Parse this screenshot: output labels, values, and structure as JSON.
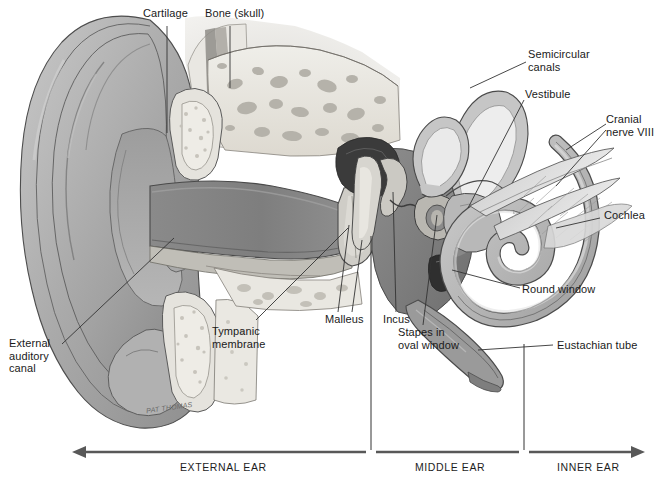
{
  "figure": {
    "artist_signature": "PAT\nTHOMAS"
  },
  "labels": [
    {
      "id": "cartilage",
      "text": "Cartilage",
      "x": 143,
      "y": 12
    },
    {
      "id": "bone-skull",
      "text": "Bone (skull)",
      "x": 205,
      "y": 12
    },
    {
      "id": "semicircular",
      "text": "Semicircular\ncanals",
      "x": 528,
      "y": 52
    },
    {
      "id": "vestibule",
      "text": "Vestibule",
      "x": 525,
      "y": 92
    },
    {
      "id": "cranial-nerve",
      "text": "Cranial\nnerve VIII",
      "x": 610,
      "y": 118
    },
    {
      "id": "cochlea",
      "text": "Cochlea",
      "x": 604,
      "y": 214
    },
    {
      "id": "round-window",
      "text": "Round window",
      "x": 522,
      "y": 288
    },
    {
      "id": "eustachian-tube",
      "text": "Eustachian tube",
      "x": 557,
      "y": 342
    },
    {
      "id": "stapes-oval-window",
      "text": "Stapes in\noval window",
      "x": 400,
      "y": 330
    },
    {
      "id": "incus",
      "text": "Incus",
      "x": 383,
      "y": 317
    },
    {
      "id": "malleus",
      "text": "Malleus",
      "x": 325,
      "y": 317
    },
    {
      "id": "tympanic-membrane",
      "text": "Tympanic\nmembrane",
      "x": 212,
      "y": 329
    },
    {
      "id": "external-auditory",
      "text": "External\nauditory\ncanal",
      "x": 10,
      "y": 341
    }
  ],
  "sections": [
    {
      "id": "external-ear",
      "text": "EXTERNAL EAR",
      "center": 221
    },
    {
      "id": "middle-ear",
      "text": "MIDDLE EAR",
      "center": 447
    },
    {
      "id": "inner-ear",
      "text": "INNER EAR",
      "center": 584
    }
  ],
  "scale_bar": {
    "y": 452,
    "left_x": 72,
    "right_x": 645,
    "divider_x": [
      371,
      524
    ],
    "label_y": 462
  },
  "colors": {
    "ink": "#1a1a1a",
    "leader": "#3a3a3a",
    "skin_light": "#d3d3d3",
    "skin_mid": "#b4b4b4",
    "skin_dark": "#909090",
    "canal_dark": "#878787",
    "bone_pale": "#e7e5df",
    "bone_speck": "#b9b6ae",
    "cavity_dark": "#7c7c7c",
    "ossicle": "#4a4a4a",
    "nerve": "#cfcfcf",
    "background": "#ffffff"
  }
}
